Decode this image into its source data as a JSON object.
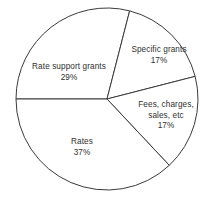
{
  "chart_data": {
    "type": "pie",
    "title": "",
    "subtitle": "",
    "xlabel": "",
    "ylabel": "",
    "legend": "none",
    "grid": false,
    "value_unit": "%",
    "total": 100,
    "start_angle_deg": 180,
    "direction": "clockwise",
    "categories": [
      "Rate support grants",
      "Specific grants",
      "Fees, charges, sales, etc",
      "Rates"
    ],
    "values": [
      29,
      17,
      17,
      37
    ],
    "slices": [
      {
        "id": "rate-support-grants",
        "label": "Rate support grants",
        "label_lines": [
          "Rate support grants"
        ],
        "value": 29,
        "value_text": "29%",
        "start_deg": 180,
        "end_deg": 284.4,
        "fill": "#ffffff",
        "stroke": "#3a3a3a"
      },
      {
        "id": "specific-grants",
        "label": "Specific grants",
        "label_lines": [
          "Specific grants"
        ],
        "value": 17,
        "value_text": "17%",
        "start_deg": 284.4,
        "end_deg": 345.6,
        "fill": "#ffffff",
        "stroke": "#3a3a3a"
      },
      {
        "id": "fees-charges-sales",
        "label": "Fees, charges, sales, etc",
        "label_lines": [
          "Fees, charges,",
          "sales, etc"
        ],
        "value": 17,
        "value_text": "17%",
        "start_deg": 345.6,
        "end_deg": 46.8,
        "fill": "#ffffff",
        "stroke": "#3a3a3a"
      },
      {
        "id": "rates",
        "label": "Rates",
        "label_lines": [
          "Rates"
        ],
        "value": 37,
        "value_text": "37%",
        "start_deg": 46.8,
        "end_deg": 180,
        "fill": "#ffffff",
        "stroke": "#3a3a3a"
      }
    ],
    "geometry": {
      "center_x": 107,
      "center_y": 99,
      "radius": 91
    },
    "colors": {
      "background": "#ffffff",
      "outline": "#3a3a3a",
      "text": "#2f2f2f"
    }
  },
  "labels": {
    "rate_support_grants": {
      "line1": "Rate support grants",
      "value": "29%"
    },
    "specific_grants": {
      "line1": "Specific grants",
      "value": "17%"
    },
    "fees_charges_sales": {
      "line1": "Fees, charges,",
      "line2": "sales, etc",
      "value": "17%"
    },
    "rates": {
      "line1": "Rates",
      "value": "37%"
    }
  }
}
